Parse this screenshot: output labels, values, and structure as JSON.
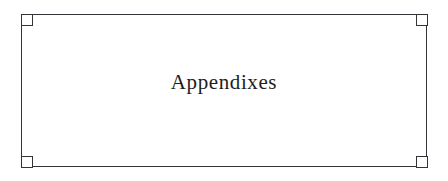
{
  "page": {
    "background_color": "#ffffff",
    "width": 448,
    "height": 181
  },
  "panel": {
    "name": "part-divider-frame",
    "border_color": "#33343a",
    "fill_color": "#ffffff",
    "corner_ornaments": [
      {
        "position": "top-left",
        "shape": "square"
      },
      {
        "position": "top-right",
        "shape": "square"
      },
      {
        "position": "bottom-left",
        "shape": "square"
      },
      {
        "position": "bottom-right",
        "shape": "square"
      }
    ]
  },
  "content": {
    "part_title": "Appendixes",
    "title_color": "#1d1d21",
    "title_alignment": "center"
  }
}
